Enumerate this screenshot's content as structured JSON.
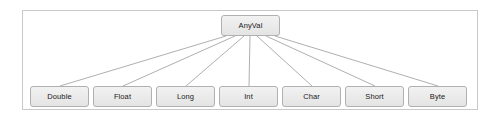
{
  "diagram": {
    "type": "class-hierarchy",
    "title": "",
    "root": {
      "label": "AnyVal"
    },
    "children": [
      {
        "label": "Double"
      },
      {
        "label": "Float"
      },
      {
        "label": "Long"
      },
      {
        "label": "Int"
      },
      {
        "label": "Char"
      },
      {
        "label": "Short"
      },
      {
        "label": "Byte"
      }
    ],
    "edges": [
      {
        "from": "AnyVal",
        "to": "Double"
      },
      {
        "from": "AnyVal",
        "to": "Float"
      },
      {
        "from": "AnyVal",
        "to": "Long"
      },
      {
        "from": "AnyVal",
        "to": "Int"
      },
      {
        "from": "AnyVal",
        "to": "Char"
      },
      {
        "from": "AnyVal",
        "to": "Short"
      },
      {
        "from": "AnyVal",
        "to": "Byte"
      }
    ],
    "colors": {
      "frame_border": "#c9c9c9",
      "box_border": "#b0b0b0",
      "box_fill": "#eaeaea",
      "line": "#8c8c8c",
      "text": "#1a1a1a",
      "background": "#ffffff"
    }
  }
}
